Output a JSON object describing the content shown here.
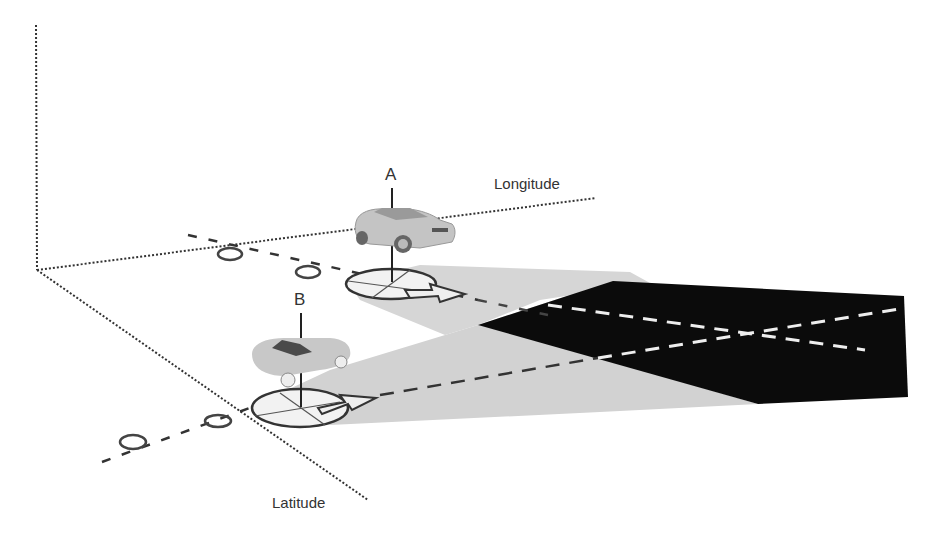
{
  "diagram": {
    "title": "",
    "axes": {
      "vertical": {
        "label": ""
      },
      "longitude": {
        "label": "Longitude"
      },
      "latitude": {
        "label": "Latitude"
      }
    },
    "vehicles": [
      {
        "id": "A",
        "label": "A",
        "type": "sedan",
        "description": "Vehicle A with sensor footprint and heading arrow, projecting a field of view to the right"
      },
      {
        "id": "B",
        "label": "B",
        "type": "convertible",
        "description": "Vehicle B with sensor footprint and heading arrow, projecting a field of view to the right"
      }
    ],
    "regions": {
      "fov_a": "Field of view of vehicle A (light gray)",
      "fov_b": "Field of view of vehicle B (light gray)",
      "overlap": "Overlapping field of view (black)"
    },
    "colors": {
      "fov": "#d4d4d4",
      "overlap": "#0b0b0b",
      "axis": "#333333",
      "trajectory": "#333333",
      "trajectory_in_overlap": "#eeeeee",
      "car_body": "#c8c8c8"
    }
  }
}
